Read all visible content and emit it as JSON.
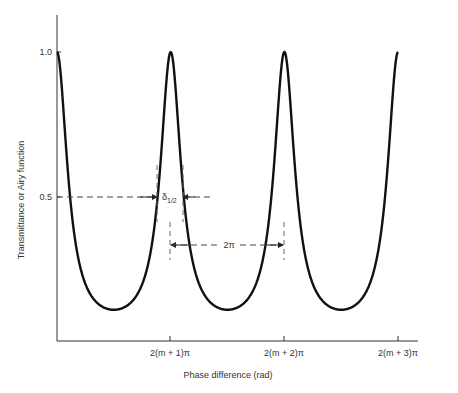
{
  "chart_data": {
    "type": "line",
    "title": "",
    "xlabel": "Phase difference (rad)",
    "ylabel": "Transmittance or Airy function",
    "x_tick_labels": [
      "2(m + 1)π",
      "2(m + 2)π",
      "2(m + 3)π"
    ],
    "y_tick_labels": [
      "0.5",
      "1.0"
    ],
    "y_ticks": [
      0.5,
      1.0
    ],
    "ylim": [
      0,
      1.1
    ],
    "grid": false,
    "series": [
      {
        "name": "Airy function",
        "function": "1/(1+F*sin^2(delta/2))",
        "coefficient_of_finesse_F": 8,
        "x_phase_over_2pi_offset": [
          0,
          1,
          2,
          3
        ],
        "peak_values": [
          1.0,
          1.0,
          1.0,
          1.0
        ],
        "minimum_value": 0.11
      }
    ],
    "annotations": [
      {
        "text": "δ1/2",
        "meaning": "full width at half maximum",
        "at_y": 0.5
      },
      {
        "text": "2π",
        "meaning": "free spectral range between adjacent peaks"
      }
    ]
  },
  "labels": {
    "ylabel": "Transmittance or Airy function",
    "xlabel": "Phase difference (rad)",
    "ytick_1": "1.0",
    "ytick_05": "0.5",
    "xtick_1": "2(m + 1)π",
    "xtick_2": "2(m + 2)π",
    "xtick_3": "2(m + 3)π",
    "fwhm_main": "δ",
    "fwhm_sub": "1/2",
    "fsr": "2π"
  }
}
